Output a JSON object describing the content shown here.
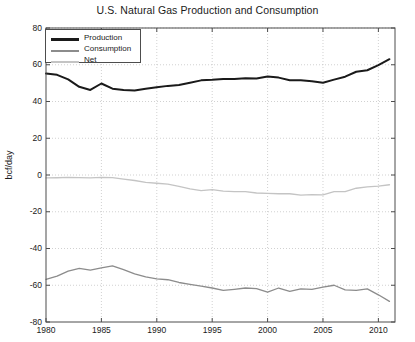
{
  "chart_data": {
    "type": "line",
    "title": "U.S. Natural Gas Production and Consumption",
    "xlabel": "",
    "ylabel": "bcf/day",
    "xlim": [
      1980,
      2011.5
    ],
    "ylim": [
      -80,
      80
    ],
    "xticks": [
      1980,
      1985,
      1990,
      1995,
      2000,
      2005,
      2010
    ],
    "xticklabels": [
      "1980",
      "1985",
      "1990",
      "1995",
      "2000",
      "2005",
      "2010"
    ],
    "yticks": [
      -80,
      -60,
      -40,
      -20,
      0,
      20,
      40,
      60,
      80
    ],
    "yticklabels": [
      "-80",
      "-60",
      "-40",
      "-20",
      "0",
      "20",
      "40",
      "60",
      "80"
    ],
    "grid": true,
    "grid_style": "dotted",
    "legend_position": "upper left",
    "x": [
      1980,
      1981,
      1982,
      1983,
      1984,
      1985,
      1986,
      1987,
      1988,
      1989,
      1990,
      1991,
      1992,
      1993,
      1994,
      1995,
      1996,
      1997,
      1998,
      1999,
      2000,
      2001,
      2002,
      2003,
      2004,
      2005,
      2006,
      2007,
      2008,
      2009,
      2010,
      2011
    ],
    "series": [
      {
        "name": "Production",
        "color": "#1a1a1a",
        "width": 2.0,
        "values": [
          55.2,
          54.5,
          52.0,
          48.0,
          46.3,
          49.8,
          47.0,
          46.3,
          46.0,
          47.0,
          47.8,
          48.5,
          49.0,
          50.2,
          51.5,
          51.8,
          52.3,
          52.3,
          52.7,
          52.5,
          53.6,
          53.0,
          51.6,
          51.6,
          51.0,
          50.2,
          51.9,
          53.5,
          56.2,
          57.0,
          59.8,
          63.0
        ]
      },
      {
        "name": "Consumption",
        "color": "#8c8c8c",
        "width": 1.3,
        "values": [
          -56.8,
          -55.0,
          -52.3,
          -50.8,
          -51.8,
          -50.5,
          -49.5,
          -51.5,
          -53.8,
          -55.5,
          -56.5,
          -57.0,
          -58.5,
          -59.5,
          -60.5,
          -61.5,
          -62.8,
          -62.2,
          -61.5,
          -61.8,
          -63.8,
          -61.5,
          -63.3,
          -62.0,
          -62.2,
          -61.0,
          -60.0,
          -62.5,
          -62.8,
          -62.0,
          -65.2,
          -68.8
        ]
      },
      {
        "name": "Net",
        "color": "#c4c4c4",
        "width": 1.3,
        "values": [
          -1.6,
          -1.5,
          -1.3,
          -1.4,
          -1.6,
          -1.3,
          -1.4,
          -2.2,
          -3.0,
          -4.0,
          -4.5,
          -5.0,
          -6.2,
          -7.5,
          -8.5,
          -8.0,
          -8.8,
          -9.0,
          -9.0,
          -9.8,
          -10.0,
          -10.2,
          -10.2,
          -11.0,
          -10.7,
          -10.8,
          -9.1,
          -9.1,
          -7.2,
          -6.5,
          -6.0,
          -5.3
        ]
      }
    ]
  },
  "legend": {
    "items": [
      {
        "label": "Production"
      },
      {
        "label": "Consumption"
      },
      {
        "label": "Net"
      }
    ]
  }
}
